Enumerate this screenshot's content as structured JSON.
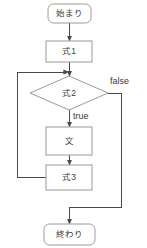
{
  "diagram": {
    "orientation": "vertical",
    "background_color": "#ffffff",
    "stroke_color": "#9a9a9a",
    "arrow_color": "#4a4a4a",
    "text_color": "#3b3b3b",
    "nodes": [
      {
        "id": "start",
        "label": "始まり",
        "shape": "rounded-rectangle",
        "x": 48,
        "y": 4,
        "width": 43,
        "height": 19
      },
      {
        "id": "expr1",
        "label": "式1",
        "shape": "rectangle",
        "x": 46,
        "y": 41,
        "width": 46,
        "height": 21
      },
      {
        "id": "cond",
        "label": "式2",
        "shape": "diamond",
        "x": 30,
        "y": 76,
        "width": 78,
        "height": 34
      },
      {
        "id": "stmt",
        "label": "文",
        "shape": "rectangle",
        "x": 46,
        "y": 127,
        "width": 46,
        "height": 28
      },
      {
        "id": "expr3",
        "label": "式3",
        "shape": "rectangle",
        "x": 46,
        "y": 165,
        "width": 46,
        "height": 25
      },
      {
        "id": "end",
        "label": "終わり",
        "shape": "rounded-rectangle",
        "x": 44,
        "y": 224,
        "width": 51,
        "height": 21
      }
    ],
    "edges": [
      {
        "id": "start-to-expr1",
        "from": "start",
        "to": "expr1",
        "label": ""
      },
      {
        "id": "expr1-to-cond",
        "from": "expr1",
        "to": "cond",
        "label": ""
      },
      {
        "id": "cond-to-stmt",
        "from": "cond",
        "to": "stmt",
        "label": "true"
      },
      {
        "id": "cond-to-end",
        "from": "cond",
        "to": "end",
        "label": "false"
      },
      {
        "id": "stmt-to-expr3",
        "from": "stmt",
        "to": "expr3",
        "label": ""
      },
      {
        "id": "expr3-to-cond",
        "from": "expr3",
        "to": "cond",
        "label": ""
      }
    ],
    "edge_labels": {
      "true": "true",
      "false": "false"
    }
  }
}
